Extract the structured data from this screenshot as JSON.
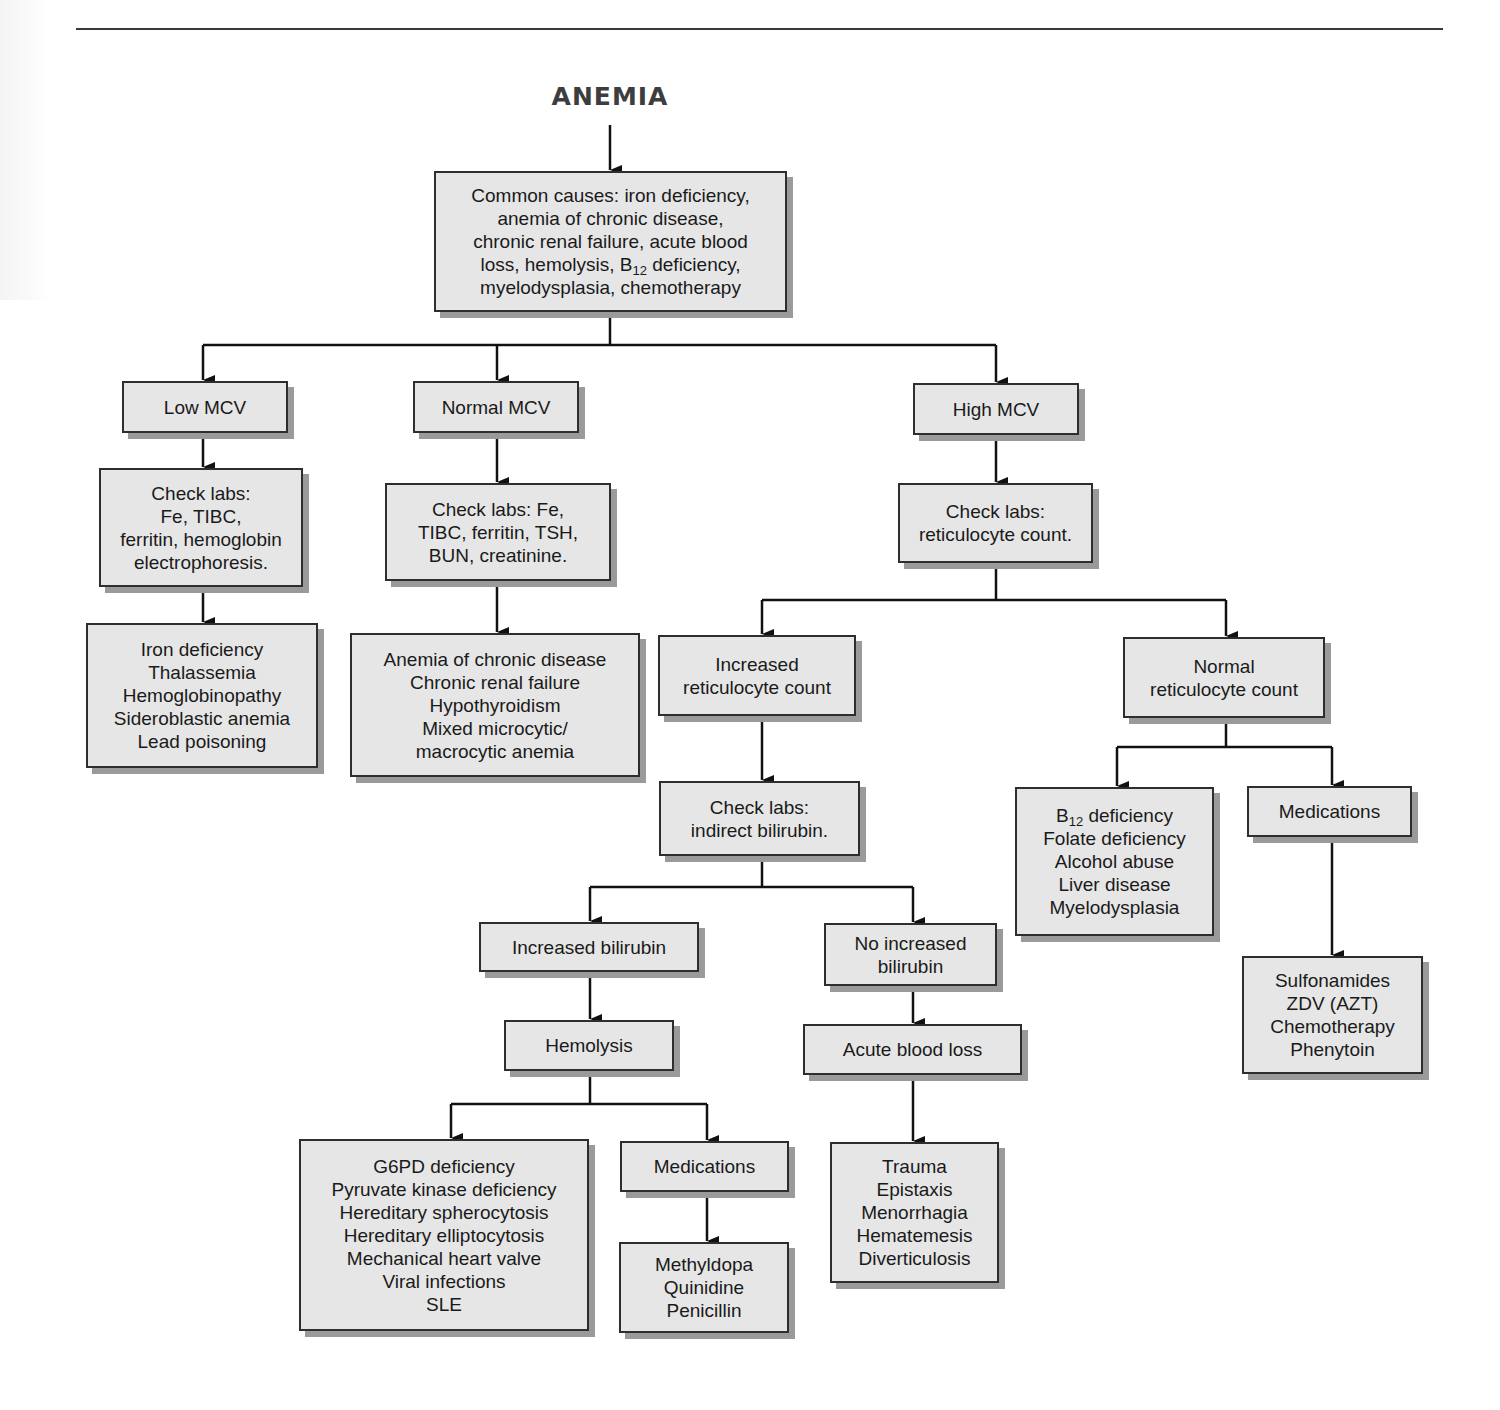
{
  "diagram": {
    "title": "ANEMIA",
    "root": {
      "lines": [
        "Common causes: iron deficiency,",
        "anemia of chronic disease,",
        "chronic renal failure, acute blood",
        "loss, hemolysis, B|12| deficiency,",
        "myelodysplasia, chemotherapy"
      ]
    },
    "low_mcv": {
      "label": "Low MCV",
      "labs": [
        "Check labs:",
        "Fe, TIBC,",
        "ferritin, hemoglobin",
        "electrophoresis."
      ],
      "causes": [
        "Iron deficiency",
        "Thalassemia",
        "Hemoglobinopathy",
        "Sideroblastic anemia",
        "Lead poisoning"
      ]
    },
    "normal_mcv": {
      "label": "Normal MCV",
      "labs": [
        "Check labs: Fe,",
        "TIBC, ferritin, TSH,",
        "BUN, creatinine."
      ],
      "causes": [
        "Anemia of chronic disease",
        "Chronic renal failure",
        "Hypothyroidism",
        "Mixed microcytic/",
        "macrocytic anemia"
      ]
    },
    "high_mcv": {
      "label": "High MCV",
      "labs": [
        "Check labs:",
        "reticulocyte count."
      ],
      "increased_retic": {
        "label": [
          "Increased",
          "reticulocyte count"
        ],
        "labs": [
          "Check labs:",
          "indirect bilirubin."
        ],
        "increased_bilirubin": {
          "label": "Increased bilirubin",
          "hemolysis": "Hemolysis",
          "causes": [
            "G6PD deficiency",
            "Pyruvate kinase deficiency",
            "Hereditary spherocytosis",
            "Hereditary elliptocytosis",
            "Mechanical heart valve",
            "Viral infections",
            "SLE"
          ],
          "medications": "Medications",
          "medication_list": [
            "Methyldopa",
            "Quinidine",
            "Penicillin"
          ]
        },
        "no_increased_bilirubin": {
          "label": [
            "No increased",
            "bilirubin"
          ],
          "acute_blood_loss": "Acute blood loss",
          "causes": [
            "Trauma",
            "Epistaxis",
            "Menorrhagia",
            "Hematemesis",
            "Diverticulosis"
          ]
        }
      },
      "normal_retic": {
        "label": [
          "Normal",
          "reticulocyte count"
        ],
        "causes": [
          "B|12| deficiency",
          "Folate deficiency",
          "Alcohol abuse",
          "Liver disease",
          "Myelodysplasia"
        ],
        "medications": "Medications",
        "medication_list": [
          "Sulfonamides",
          "ZDV (AZT)",
          "Chemotherapy",
          "Phenytoin"
        ]
      }
    }
  },
  "colors": {
    "box_fill": "#e6e6e6",
    "box_border": "#2e2e2e",
    "box_shadow": "#9a9a9a",
    "line": "#111111",
    "title": "#3d3d3d"
  }
}
